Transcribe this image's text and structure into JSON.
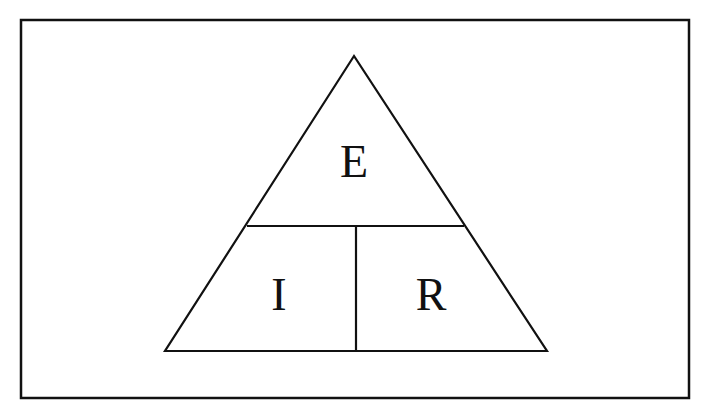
{
  "diagram": {
    "colors": {
      "stroke": "#111111",
      "background": "#ffffff"
    },
    "frame": {
      "x": 21,
      "y": 20,
      "width": 668,
      "height": 378
    },
    "triangle": {
      "apex": [
        354,
        56
      ],
      "base_left": [
        165,
        351
      ],
      "base_right": [
        547,
        351
      ],
      "divider_y": 226,
      "divider_x": 356
    },
    "labels": {
      "top": "E",
      "bottom_left": "I",
      "bottom_right": "R"
    }
  }
}
